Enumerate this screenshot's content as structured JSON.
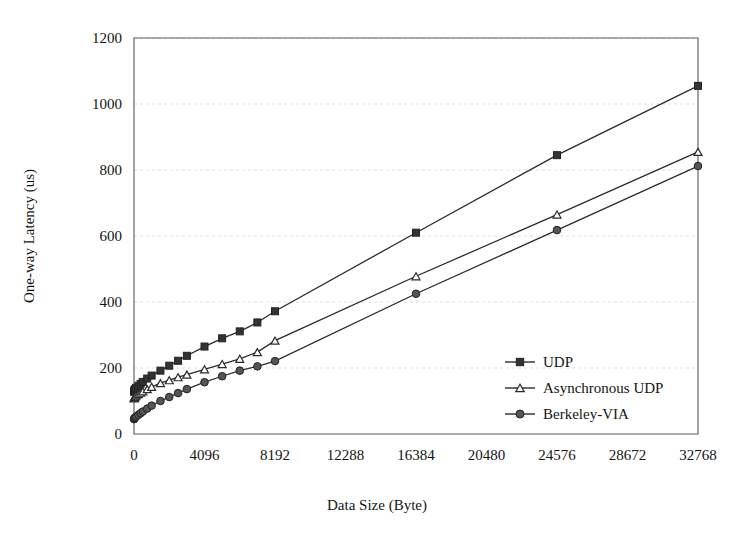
{
  "chart_data": {
    "type": "line",
    "title": "",
    "xlabel": "Data Size (Byte)",
    "ylabel": "One-way Latency (us)",
    "xlim": [
      0,
      32768
    ],
    "ylim": [
      0,
      1200
    ],
    "xticks": [
      0,
      4096,
      8192,
      12288,
      16384,
      20480,
      24576,
      28672,
      32768
    ],
    "xtick_labels": [
      "0",
      "4096",
      "8192",
      "12288",
      "16384",
      "20480",
      "24576",
      "28672",
      "32768"
    ],
    "yticks": [
      0,
      200,
      400,
      600,
      800,
      1000,
      1200
    ],
    "ytick_labels": [
      "0",
      "200",
      "400",
      "600",
      "800",
      "1000",
      "1200"
    ],
    "grid": "horizontal-dotted",
    "legend_position": "inside-right",
    "series": [
      {
        "name": "UDP",
        "marker": "filled-square",
        "color": "#333333",
        "x": [
          4,
          16,
          32,
          64,
          128,
          256,
          384,
          512,
          768,
          1024,
          1536,
          2048,
          2560,
          3072,
          4096,
          5120,
          6144,
          7168,
          8192,
          16384,
          24576,
          32768
        ],
        "y": [
          128,
          130,
          133,
          136,
          140,
          146,
          152,
          158,
          168,
          177,
          192,
          207,
          222,
          237,
          265,
          290,
          311,
          338,
          372,
          610,
          845,
          1055
        ]
      },
      {
        "name": "Asynchronous UDP",
        "marker": "hollow-triangle",
        "color": "#2b2b2b",
        "x": [
          4,
          16,
          32,
          64,
          128,
          256,
          384,
          512,
          768,
          1024,
          1536,
          2048,
          2560,
          3072,
          4096,
          5120,
          6144,
          7168,
          8192,
          16384,
          24576,
          32768
        ],
        "y": [
          108,
          110,
          112,
          114,
          117,
          121,
          125,
          129,
          136,
          143,
          154,
          163,
          172,
          180,
          196,
          212,
          228,
          248,
          283,
          478,
          665,
          855
        ]
      },
      {
        "name": "Berkeley-VIA",
        "marker": "filled-circle",
        "color": "#555555",
        "x": [
          4,
          16,
          32,
          64,
          128,
          256,
          384,
          512,
          768,
          1024,
          1536,
          2048,
          2560,
          3072,
          4096,
          5120,
          6144,
          7168,
          8192,
          16384,
          24576,
          32768
        ],
        "y": [
          45,
          46,
          48,
          50,
          53,
          58,
          63,
          68,
          77,
          86,
          100,
          112,
          124,
          136,
          157,
          175,
          192,
          205,
          221,
          425,
          618,
          812
        ]
      }
    ]
  },
  "legend": {
    "entries": [
      {
        "label": "UDP",
        "marker": "filled-square"
      },
      {
        "label": "Asynchronous UDP",
        "marker": "hollow-triangle"
      },
      {
        "label": "Berkeley-VIA",
        "marker": "filled-circle"
      }
    ]
  },
  "axes": {
    "x_title": "Data Size (Byte)",
    "y_title": "One-way Latency (us)"
  }
}
